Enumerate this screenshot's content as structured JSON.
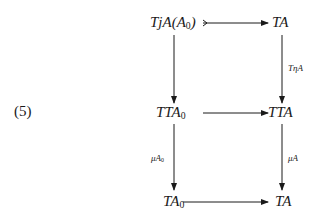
{
  "equation_number": "(5)",
  "nodes": {
    "top_left": {
      "main": "TjA(A",
      "sub": "0",
      "tail": ")"
    },
    "top_right": {
      "main": "TA"
    },
    "mid_left": {
      "main": "TTA",
      "sub": "0"
    },
    "mid_right": {
      "main": "TTA"
    },
    "bot_left": {
      "main": "TA",
      "sub": "0"
    },
    "bot_right": {
      "main": "TA"
    }
  },
  "arrow_labels": {
    "right_upper": "TηA",
    "left_lower": {
      "main": "μA",
      "sub": "0"
    },
    "right_lower": "μA"
  },
  "arrows": [
    {
      "from": "top_left",
      "to": "top_right",
      "type": "mono-tail"
    },
    {
      "from": "top_left",
      "to": "mid_left"
    },
    {
      "from": "top_right",
      "to": "mid_right",
      "label": "TηA"
    },
    {
      "from": "mid_left",
      "to": "mid_right"
    },
    {
      "from": "mid_left",
      "to": "bot_left",
      "label": "μA0"
    },
    {
      "from": "mid_right",
      "to": "bot_right",
      "label": "μA"
    },
    {
      "from": "bot_left",
      "to": "bot_right"
    }
  ],
  "colors": {
    "ink": "#1a1a1a",
    "background": "#ffffff"
  }
}
